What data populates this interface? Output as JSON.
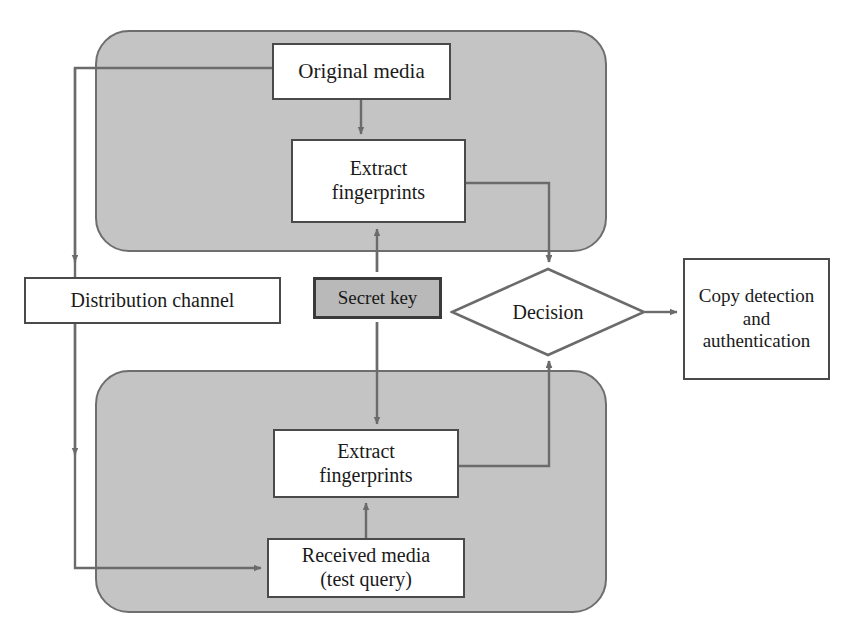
{
  "diagram": {
    "colors": {
      "panel_fill": "#c4c4c4",
      "panel_stroke": "#6e6e6e",
      "node_fill": "#ffffff",
      "node_stroke": "#4a4a4a",
      "key_fill": "#b9b9b9",
      "key_stroke": "#3a3a3a",
      "wire": "#6b6b6b",
      "text": "#1a1a1a",
      "background": "#ffffff"
    },
    "groups": [
      {
        "id": "enrollment-group",
        "label": ""
      },
      {
        "id": "query-group",
        "label": ""
      }
    ],
    "nodes": [
      {
        "id": "original-media",
        "label": "Original media",
        "shape": "rect",
        "fill": "white"
      },
      {
        "id": "extract-fingerprints-top",
        "label": "Extract\nfingerprints",
        "shape": "rect",
        "fill": "white"
      },
      {
        "id": "distribution-channel",
        "label": "Distribution channel",
        "shape": "rect",
        "fill": "white"
      },
      {
        "id": "secret-key",
        "label": "Secret key",
        "shape": "rect",
        "fill": "gray"
      },
      {
        "id": "decision",
        "label": "Decision",
        "shape": "diamond",
        "fill": "white"
      },
      {
        "id": "copy-detection",
        "label": "Copy detection\nand\nauthentication",
        "shape": "rect",
        "fill": "white"
      },
      {
        "id": "extract-fingerprints-bottom",
        "label": "Extract\nfingerprints",
        "shape": "rect",
        "fill": "white"
      },
      {
        "id": "received-media",
        "label": "Received media\n(test query)",
        "shape": "rect",
        "fill": "white"
      }
    ],
    "edges": [
      {
        "from": "original-media",
        "to": "distribution-channel",
        "label": "",
        "arrow": "single"
      },
      {
        "from": "original-media",
        "to": "extract-fingerprints-top",
        "label": "",
        "arrow": "single"
      },
      {
        "from": "secret-key",
        "to": "extract-fingerprints-top",
        "label": "",
        "arrow": "double"
      },
      {
        "from": "secret-key",
        "to": "extract-fingerprints-bottom",
        "label": "",
        "arrow": "double"
      },
      {
        "from": "extract-fingerprints-top",
        "to": "decision",
        "label": "",
        "arrow": "single"
      },
      {
        "from": "extract-fingerprints-bottom",
        "to": "decision",
        "label": "",
        "arrow": "single"
      },
      {
        "from": "distribution-channel",
        "to": "received-media",
        "label": "",
        "arrow": "single"
      },
      {
        "from": "received-media",
        "to": "extract-fingerprints-bottom",
        "label": "",
        "arrow": "single"
      },
      {
        "from": "decision",
        "to": "copy-detection",
        "label": "",
        "arrow": "single"
      }
    ]
  }
}
